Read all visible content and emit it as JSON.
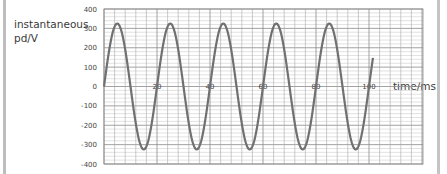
{
  "chart_data": {
    "type": "line",
    "title": "",
    "xlabel": "time/ms",
    "ylabel": "instantaneous pd/V",
    "xlim": [
      0,
      120
    ],
    "ylim": [
      -400,
      400
    ],
    "x_ticks": [
      20,
      40,
      60,
      80,
      100
    ],
    "y_ticks": [
      400,
      300,
      200,
      100,
      0,
      -100,
      -200,
      -300,
      -400
    ],
    "grid": true,
    "series": [
      {
        "name": "instantaneous pd",
        "function": "325*sin(2*pi*t/20)",
        "amplitude": 325,
        "period_ms": 20,
        "frequency_hz": 50,
        "x": [
          0,
          5,
          10,
          15,
          20,
          25,
          30,
          35,
          40,
          45,
          50,
          55,
          60,
          65,
          70,
          75,
          80,
          85,
          90,
          95,
          100,
          101.5
        ],
        "values": [
          0,
          325,
          0,
          -325,
          0,
          325,
          0,
          -325,
          0,
          325,
          0,
          -325,
          0,
          325,
          0,
          -325,
          0,
          325,
          0,
          -325,
          0,
          130
        ]
      }
    ],
    "colors": {
      "curve": "#707070",
      "grid_major": "#8a8a8a",
      "grid_minor": "#cfcfcf",
      "sidebar": "#bdbdbd"
    }
  },
  "labels": {
    "ylabel_line1": "instantaneous",
    "ylabel_line2": "pd/V",
    "xlabel": "time/ms"
  }
}
